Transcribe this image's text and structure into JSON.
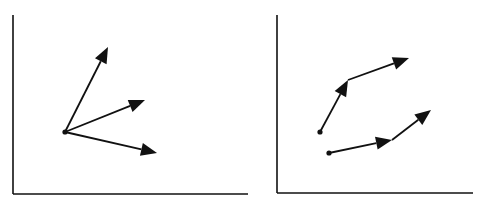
{
  "colors": {
    "ink": "#111111",
    "background": "#ffffff"
  },
  "panels": [
    {
      "name": "left",
      "axes": {
        "origin": [
          13,
          194
        ],
        "y_top": 15,
        "x_end": 248
      },
      "points": [
        [
          65,
          132
        ]
      ],
      "arrows": [
        {
          "from": [
            65,
            132
          ],
          "to": [
            108,
            47
          ]
        },
        {
          "from": [
            65,
            132
          ],
          "to": [
            145,
            100
          ]
        },
        {
          "from": [
            65,
            132
          ],
          "to": [
            157,
            153
          ]
        }
      ]
    },
    {
      "name": "right",
      "axes": {
        "origin": [
          277,
          193
        ],
        "y_top": 15,
        "x_end": 473
      },
      "points": [
        [
          320,
          132
        ],
        [
          329,
          153
        ]
      ],
      "arrows": [
        {
          "from": [
            320,
            132
          ],
          "to": [
            348,
            80
          ]
        },
        {
          "from": [
            348,
            80
          ],
          "to": [
            409,
            58
          ]
        },
        {
          "from": [
            329,
            153
          ],
          "to": [
            392,
            140
          ]
        },
        {
          "from": [
            392,
            140
          ],
          "to": [
            431,
            110
          ]
        }
      ]
    }
  ]
}
